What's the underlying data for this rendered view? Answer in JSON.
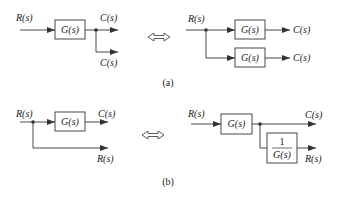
{
  "diagram_a": {
    "caption": "(a)",
    "left": {
      "input": "R(s)",
      "block": "G(s)",
      "output_top": "C(s)",
      "output_bottom": "C(s)"
    },
    "equivalence": "⟺",
    "right": {
      "input": "R(s)",
      "block_top": "G(s)",
      "block_bottom": "G(s)",
      "output_top": "C(s)",
      "output_bottom": "C(s)"
    }
  },
  "diagram_b": {
    "caption": "(b)",
    "left": {
      "input": "R(s)",
      "block": "G(s)",
      "output_top": "C(s)",
      "output_bottom": "R(s)"
    },
    "equivalence": "⟺",
    "right": {
      "input": "R(s)",
      "block": "G(s)",
      "inverse_numerator": "1",
      "inverse_denominator": "G(s)",
      "output_top": "C(s)",
      "output_bottom": "R(s)"
    }
  }
}
